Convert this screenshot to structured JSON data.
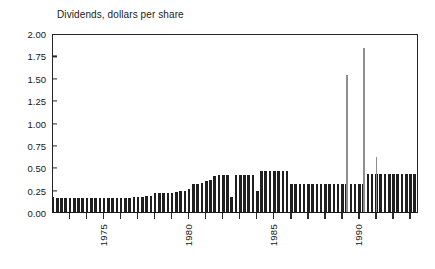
{
  "chart_data": {
    "type": "bar",
    "title": "Dividends, dollars per share",
    "xlabel": "",
    "ylabel": "",
    "ylim": [
      0.0,
      2.0
    ],
    "grid": false,
    "legend": null,
    "ytick_labels": [
      "0.00",
      "0.25",
      "0.50",
      "0.75",
      "1.00",
      "1.25",
      "1.50",
      "1.75",
      "2.00"
    ],
    "ytick_values": [
      0.0,
      0.25,
      0.5,
      0.75,
      1.0,
      1.25,
      1.5,
      1.75,
      2.0
    ],
    "xtick_labels": [
      "1975",
      "1980",
      "1985",
      "1990"
    ],
    "xtick_values": [
      1975,
      1980,
      1985,
      1990
    ],
    "x_axis_range": [
      1972.0,
      1993.5
    ],
    "x_units": "quarters",
    "series": [
      {
        "name": "Regular dividends",
        "color": "#1f1f1f",
        "x": [
          1972.0,
          1972.25,
          1972.5,
          1972.75,
          1973.0,
          1973.25,
          1973.5,
          1973.75,
          1974.0,
          1974.25,
          1974.5,
          1974.75,
          1975.0,
          1975.25,
          1975.5,
          1975.75,
          1976.0,
          1976.25,
          1976.5,
          1976.75,
          1977.0,
          1977.25,
          1977.5,
          1977.75,
          1978.0,
          1978.25,
          1978.5,
          1978.75,
          1979.0,
          1979.25,
          1979.5,
          1979.75,
          1980.0,
          1980.25,
          1980.5,
          1980.75,
          1981.0,
          1981.25,
          1981.5,
          1981.75,
          1982.0,
          1982.25,
          1982.5,
          1982.75,
          1983.0,
          1983.25,
          1983.5,
          1983.75,
          1984.0,
          1984.25,
          1984.5,
          1984.75,
          1985.0,
          1985.25,
          1985.5,
          1985.75,
          1986.0,
          1986.25,
          1986.5,
          1986.75,
          1987.0,
          1987.25,
          1987.5,
          1987.75,
          1988.0,
          1988.25,
          1988.5,
          1988.75,
          1989.0,
          1989.25,
          1989.5,
          1989.75,
          1990.0,
          1990.25,
          1990.5,
          1990.75,
          1991.0,
          1991.25,
          1991.5,
          1991.75,
          1992.0,
          1992.25,
          1992.5,
          1992.75,
          1993.0,
          1993.25
        ],
        "values": [
          0.17,
          0.16,
          0.16,
          0.16,
          0.16,
          0.16,
          0.16,
          0.16,
          0.16,
          0.16,
          0.16,
          0.16,
          0.16,
          0.16,
          0.16,
          0.16,
          0.16,
          0.16,
          0.16,
          0.17,
          0.17,
          0.17,
          0.18,
          0.18,
          0.21,
          0.21,
          0.21,
          0.21,
          0.21,
          0.22,
          0.23,
          0.23,
          0.26,
          0.31,
          0.31,
          0.32,
          0.35,
          0.36,
          0.4,
          0.41,
          0.41,
          0.41,
          0.17,
          0.41,
          0.41,
          0.41,
          0.41,
          0.41,
          0.24,
          0.46,
          0.46,
          0.46,
          0.46,
          0.46,
          0.46,
          0.46,
          0.31,
          0.31,
          0.31,
          0.31,
          0.31,
          0.31,
          0.31,
          0.31,
          0.31,
          0.31,
          0.31,
          0.31,
          0.31,
          0.31,
          0.31,
          0.31,
          0.31,
          0.31,
          0.42,
          0.42,
          0.42,
          0.42,
          0.42,
          0.42,
          0.42,
          0.42,
          0.42,
          0.42,
          0.42,
          0.42
        ]
      },
      {
        "name": "Special dividends",
        "color": "#8f8f8f",
        "x": [
          1989.25,
          1990.25,
          1991.0
        ],
        "values": [
          1.53,
          1.83,
          0.62
        ]
      }
    ]
  },
  "accent_colors": {
    "bar": "#1f1f1f",
    "spike": "#8f8f8f",
    "axis": "#262626",
    "text": "#171717",
    "background": "#ffffff"
  }
}
